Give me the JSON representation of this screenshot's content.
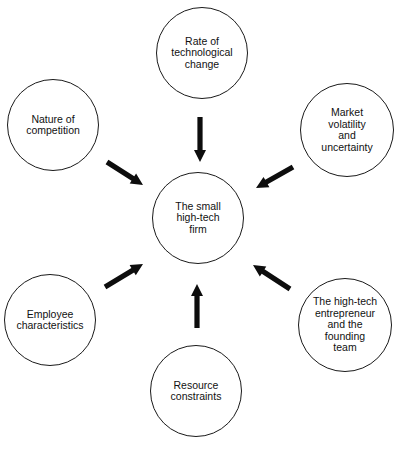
{
  "diagram": {
    "type": "hub-and-spoke",
    "center": {
      "id": "firm",
      "label": "The small\nhigh-tech\nfirm",
      "cx": 198,
      "cy": 218,
      "r": 46
    },
    "nodes": [
      {
        "id": "tech",
        "label": "Rate of\ntechnological\nchange",
        "cx": 202,
        "cy": 53,
        "r": 46
      },
      {
        "id": "market",
        "label": "Market\nvolatility\nand\nuncertainty",
        "cx": 347,
        "cy": 130,
        "r": 47
      },
      {
        "id": "entrepreneur",
        "label": "The high-tech\nentrepreneur\nand the\nfounding\nteam",
        "cx": 345,
        "cy": 325,
        "r": 47
      },
      {
        "id": "resource",
        "label": "Resource\nconstraints",
        "cx": 196,
        "cy": 391,
        "r": 46
      },
      {
        "id": "employee",
        "label": "Employee\ncharacteristics",
        "cx": 50,
        "cy": 320,
        "r": 46
      },
      {
        "id": "competition",
        "label": "Nature of\ncompetition",
        "cx": 53,
        "cy": 125,
        "r": 46
      }
    ],
    "arrows": [
      {
        "from": "tech",
        "to": "firm",
        "x1": 200,
        "y1": 117,
        "x2": 200,
        "y2": 162
      },
      {
        "from": "market",
        "to": "firm",
        "x1": 293,
        "y1": 167,
        "x2": 256,
        "y2": 188
      },
      {
        "from": "entrepreneur",
        "to": "firm",
        "x1": 290,
        "y1": 289,
        "x2": 253,
        "y2": 265
      },
      {
        "from": "resource",
        "to": "firm",
        "x1": 197,
        "y1": 328,
        "x2": 197,
        "y2": 284
      },
      {
        "from": "employee",
        "to": "firm",
        "x1": 105,
        "y1": 287,
        "x2": 143,
        "y2": 264
      },
      {
        "from": "competition",
        "to": "firm",
        "x1": 107,
        "y1": 162,
        "x2": 143,
        "y2": 185
      }
    ],
    "colors": {
      "stroke": "#1a1a1a",
      "arrow": "#0d0d0d",
      "background": "#ffffff"
    }
  }
}
